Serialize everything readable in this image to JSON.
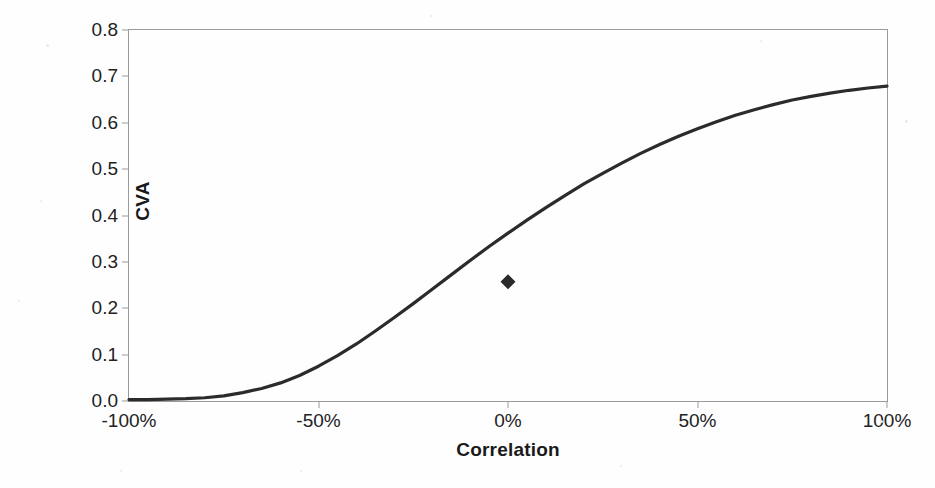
{
  "chart_data": {
    "type": "line",
    "title": "",
    "xlabel": "Correlation",
    "ylabel": "CVA",
    "xlim": [
      -100,
      100
    ],
    "ylim": [
      0.0,
      0.8
    ],
    "grid": false,
    "legend": null,
    "x_tick_labels": [
      "-100%",
      "-50%",
      "0%",
      "50%",
      "100%"
    ],
    "x_tick_values": [
      -100,
      -50,
      0,
      50,
      100
    ],
    "y_tick_labels": [
      "0.0",
      "0.1",
      "0.2",
      "0.3",
      "0.4",
      "0.5",
      "0.6",
      "0.7",
      "0.8"
    ],
    "y_tick_values": [
      0.0,
      0.1,
      0.2,
      0.3,
      0.4,
      0.5,
      0.6,
      0.7,
      0.8
    ],
    "series": [
      {
        "name": "CVA",
        "line_color": "#2b2b2b",
        "line_width": 3.2,
        "x": [
          -100,
          -95,
          -90,
          -85,
          -80,
          -75,
          -70,
          -65,
          -60,
          -55,
          -50,
          -45,
          -40,
          -35,
          -30,
          -25,
          -20,
          -15,
          -10,
          -5,
          0,
          5,
          10,
          15,
          20,
          25,
          30,
          35,
          40,
          45,
          50,
          55,
          60,
          65,
          70,
          75,
          80,
          85,
          90,
          95,
          100
        ],
        "y": [
          0.003,
          0.003,
          0.004,
          0.005,
          0.007,
          0.011,
          0.018,
          0.027,
          0.039,
          0.055,
          0.075,
          0.098,
          0.123,
          0.151,
          0.18,
          0.21,
          0.241,
          0.272,
          0.303,
          0.333,
          0.362,
          0.39,
          0.417,
          0.443,
          0.468,
          0.491,
          0.513,
          0.534,
          0.553,
          0.571,
          0.587,
          0.602,
          0.616,
          0.628,
          0.639,
          0.649,
          0.657,
          0.664,
          0.67,
          0.675,
          0.679
        ]
      }
    ],
    "markers": [
      {
        "name": "base-case-point",
        "shape": "diamond",
        "x": 0,
        "y": 0.257,
        "color": "#2b2b2b",
        "size": 15
      }
    ]
  },
  "axes": {
    "y_title": "CVA",
    "x_title": "Correlation"
  },
  "colors": {
    "line": "#2b2b2b",
    "marker": "#2b2b2b",
    "frame": "#9a9a9a",
    "text": "#222222",
    "background": "#fefefe"
  }
}
